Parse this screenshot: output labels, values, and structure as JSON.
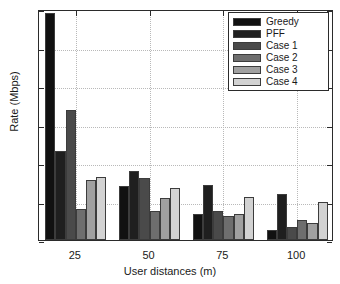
{
  "chart_data": {
    "type": "bar",
    "title": "",
    "xlabel": "User distances (m)",
    "ylabel": "Rate (Mbps)",
    "categories": [
      "25",
      "50",
      "75",
      "100"
    ],
    "xtick_labels": [
      "25",
      "50",
      "75",
      "100"
    ],
    "ytick_labels": [
      "0",
      "10",
      "20",
      "30",
      "40",
      "50",
      "60"
    ],
    "ylim": [
      0,
      60
    ],
    "yticks": [
      0,
      10,
      20,
      30,
      40,
      50,
      60
    ],
    "grid": true,
    "grid_style": "dotted",
    "legend_position": "top-right",
    "series": [
      {
        "name": "Greedy",
        "color": "#111111",
        "values": [
          59.0,
          14.0,
          6.7,
          2.6
        ]
      },
      {
        "name": "PFF",
        "color": "#1f1f1f",
        "values": [
          23.0,
          17.8,
          14.3,
          12.0
        ]
      },
      {
        "name": "Case 1",
        "color": "#4a4a4a",
        "values": [
          33.8,
          16.0,
          7.5,
          3.3
        ]
      },
      {
        "name": "Case 2",
        "color": "#6e6e6e",
        "values": [
          8.0,
          7.6,
          6.3,
          5.3
        ]
      },
      {
        "name": "Case 3",
        "color": "#a0a0a0",
        "values": [
          15.5,
          10.8,
          6.8,
          4.5
        ]
      },
      {
        "name": "Case 4",
        "color": "#d2d2d2",
        "values": [
          16.3,
          13.6,
          11.2,
          9.8
        ]
      }
    ]
  },
  "legend": {
    "entries": [
      "Greedy",
      "PFF",
      "Case 1",
      "Case 2",
      "Case 3",
      "Case 4"
    ]
  },
  "axes": {
    "x_title": "User distances (m)",
    "y_title": "Rate (Mbps)"
  }
}
